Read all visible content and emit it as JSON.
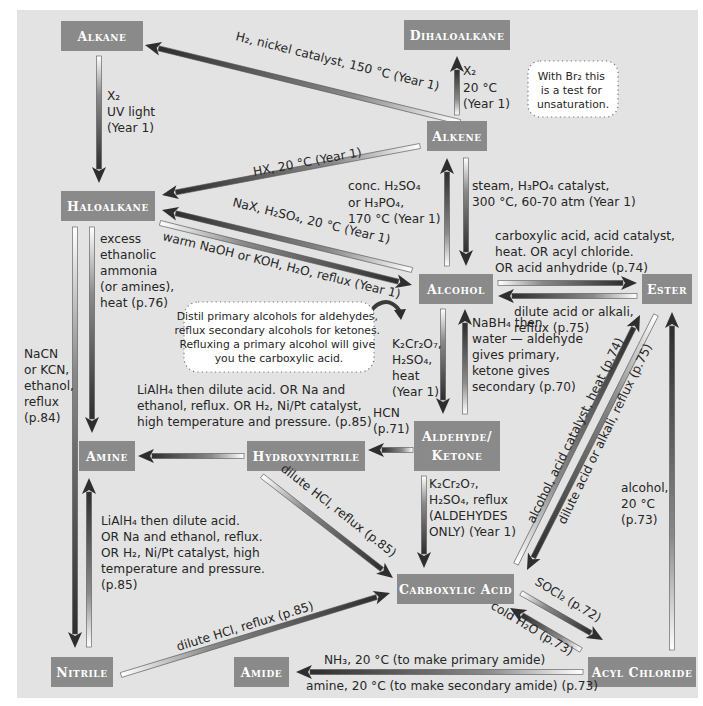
{
  "colors": {
    "background": "#e3e3e3",
    "node_fill": "#8a8a8a",
    "node_text": "#ffffff",
    "arrow_dark": "#3a3a3a",
    "arrow_light": "#ffffff",
    "label_text": "#262626"
  },
  "nodes": [
    {
      "id": "alkane",
      "label": "Alkane",
      "x": 61,
      "y": 21,
      "w": 82,
      "h": 30
    },
    {
      "id": "dihaloalkane",
      "label": "Dihaloalkane",
      "x": 404,
      "y": 20,
      "w": 106,
      "h": 30
    },
    {
      "id": "alkene",
      "label": "Alkene",
      "x": 427,
      "y": 121,
      "w": 60,
      "h": 30
    },
    {
      "id": "haloalkane",
      "label": "Haloalkane",
      "x": 61,
      "y": 191,
      "w": 94,
      "h": 30
    },
    {
      "id": "alcohol",
      "label": "Alcohol",
      "x": 419,
      "y": 274,
      "w": 74,
      "h": 30
    },
    {
      "id": "ester",
      "label": "Ester",
      "x": 642,
      "y": 274,
      "w": 50,
      "h": 30
    },
    {
      "id": "amine",
      "label": "Amine",
      "x": 79,
      "y": 441,
      "w": 56,
      "h": 30
    },
    {
      "id": "hydroxynitrile",
      "label": "Hydroxynitrile",
      "x": 247,
      "y": 441,
      "w": 118,
      "h": 30
    },
    {
      "id": "aldehyde_ketone",
      "label": "Aldehyde/",
      "label2": "Ketone",
      "x": 414,
      "y": 421,
      "w": 86,
      "h": 50
    },
    {
      "id": "carboxylic_acid",
      "label": "Carboxylic Acid",
      "x": 397,
      "y": 574,
      "w": 117,
      "h": 30
    },
    {
      "id": "nitrile",
      "label": "Nitrile",
      "x": 51,
      "y": 657,
      "w": 62,
      "h": 30
    },
    {
      "id": "amide",
      "label": "Amide",
      "x": 234,
      "y": 657,
      "w": 55,
      "h": 30
    },
    {
      "id": "acyl_chloride",
      "label": "Acyl Chloride",
      "x": 588,
      "y": 657,
      "w": 108,
      "h": 30
    }
  ],
  "arrows": [
    {
      "id": "alkene-to-alkane",
      "from": [
        460,
        122
      ],
      "to": [
        145,
        45
      ],
      "label": "alkene → alkane"
    },
    {
      "id": "alkane-to-haloalkane",
      "from": [
        99,
        56
      ],
      "to": [
        99,
        183
      ],
      "label": "alkane → haloalkane"
    },
    {
      "id": "alkene-to-dihaloalkane",
      "from": [
        457,
        115
      ],
      "to": [
        457,
        56
      ],
      "label": "alkene → dihaloalkane"
    },
    {
      "id": "alkene-to-haloalkane",
      "from": [
        420,
        146
      ],
      "to": [
        162,
        195
      ],
      "label": "alkene → haloalkane"
    },
    {
      "id": "alcohol-to-alkene",
      "from": [
        447,
        266
      ],
      "to": [
        447,
        158
      ],
      "label": "alcohol → alkene"
    },
    {
      "id": "alkene-to-alcohol",
      "from": [
        466,
        158
      ],
      "to": [
        466,
        266
      ],
      "label": "alkene → alcohol"
    },
    {
      "id": "alcohol-to-haloalkane",
      "from": [
        412,
        270
      ],
      "to": [
        162,
        210
      ],
      "label": "alcohol → haloalkane"
    },
    {
      "id": "haloalkane-to-alcohol",
      "from": [
        160,
        223
      ],
      "to": [
        412,
        285
      ],
      "label": "haloalkane → alcohol"
    },
    {
      "id": "alcohol-to-ester",
      "from": [
        498,
        283
      ],
      "to": [
        637,
        283
      ],
      "label": "alcohol → ester"
    },
    {
      "id": "ester-to-alcohol",
      "from": [
        637,
        296
      ],
      "to": [
        498,
        296
      ],
      "label": "ester → alcohol"
    },
    {
      "id": "haloalkane-to-amine",
      "from": [
        92,
        227
      ],
      "to": [
        92,
        433
      ],
      "label": "haloalkane → amine"
    },
    {
      "id": "haloalkane-to-nitrile",
      "from": [
        75,
        227
      ],
      "to": [
        75,
        648
      ],
      "label": "haloalkane → nitrile"
    },
    {
      "id": "nitrile-to-amine",
      "from": [
        89,
        647
      ],
      "to": [
        89,
        478
      ],
      "label": "nitrile → amine"
    },
    {
      "id": "alcohol-to-aldehyde",
      "from": [
        443,
        309
      ],
      "to": [
        443,
        414
      ],
      "label": "alcohol → aldehyde/ketone"
    },
    {
      "id": "aldehyde-to-alcohol",
      "from": [
        465,
        414
      ],
      "to": [
        465,
        309
      ],
      "label": "aldehyde/ketone → alcohol"
    },
    {
      "id": "aldehyde-to-hydroxynitrile",
      "from": [
        413,
        450
      ],
      "to": [
        368,
        450
      ],
      "label": "aldehyde → hydroxynitrile"
    },
    {
      "id": "hydroxynitrile-to-amine",
      "from": [
        244,
        456
      ],
      "to": [
        138,
        456
      ],
      "label": "hydroxynitrile → amine"
    },
    {
      "id": "hydroxynitrile-to-carboxylic",
      "from": [
        262,
        476
      ],
      "to": [
        393,
        578
      ],
      "label": "hydroxynitrile → carboxylic acid"
    },
    {
      "id": "aldehyde-to-carboxylic",
      "from": [
        424,
        476
      ],
      "to": [
        424,
        568
      ],
      "label": "aldehyde → carboxylic acid"
    },
    {
      "id": "carboxylic-to-ester",
      "from": [
        516,
        564
      ],
      "to": [
        640,
        315
      ],
      "label": "carboxylic acid → ester"
    },
    {
      "id": "ester-to-carboxylic",
      "from": [
        656,
        315
      ],
      "to": [
        527,
        570
      ],
      "label": "ester → carboxylic acid"
    },
    {
      "id": "acyl-to-ester",
      "from": [
        672,
        650
      ],
      "to": [
        672,
        312
      ],
      "label": "acyl chloride → ester"
    },
    {
      "id": "carboxylic-to-acyl",
      "from": [
        521,
        593
      ],
      "to": [
        603,
        640
      ],
      "label": "carboxylic acid → acyl chloride"
    },
    {
      "id": "acyl-to-carboxylic",
      "from": [
        581,
        650
      ],
      "to": [
        510,
        608
      ],
      "label": "acyl chloride → carboxylic acid"
    },
    {
      "id": "nitrile-to-carboxylic",
      "from": [
        121,
        675
      ],
      "to": [
        390,
        593
      ],
      "label": "nitrile → carboxylic acid"
    },
    {
      "id": "acyl-to-amide",
      "from": [
        583,
        672
      ],
      "to": [
        296,
        672
      ],
      "label": "acyl chloride → amide"
    }
  ],
  "labels": {
    "alkene_alkane": "H₂, nickel catalyst, 150 °C (Year 1)",
    "alkane_haloalkane": [
      "X₂",
      "UV light",
      "(Year 1)"
    ],
    "alkene_dihaloalkane": [
      "X₂",
      "20 °C",
      "(Year 1)"
    ],
    "alkene_haloalkane": "HX, 20 °C (Year 1)",
    "alcohol_alkene": [
      "conc. H₂SO₄",
      "or H₃PO₄,",
      "170 °C (Year 1)"
    ],
    "alkene_alcohol": [
      "steam, H₃PO₄ catalyst,",
      "300 °C, 60-70 atm (Year 1)"
    ],
    "alcohol_haloalkane": "NaX, H₂SO₄, 20 °C (Year 1)",
    "haloalkane_alcohol": "warm NaOH or KOH, H₂O, reflux (Year 1)",
    "alcohol_ester": [
      "carboxylic acid, acid catalyst,",
      "heat.  OR acyl chloride.",
      "OR acid anhydride (p.74)"
    ],
    "ester_alcohol": [
      "dilute acid or alkali,",
      "reflux (p.75)"
    ],
    "haloalkane_amine": [
      "excess",
      "ethanolic",
      "ammonia",
      "(or amines),",
      "heat (p.76)"
    ],
    "haloalkane_nitrile": [
      "NaCN",
      "or KCN,",
      "ethanol,",
      "reflux",
      "(p.84)"
    ],
    "alcohol_aldehyde": [
      "K₂Cr₂O₇,",
      "H₂SO₄,",
      "heat",
      "(Year 1)"
    ],
    "aldehyde_alcohol": [
      "NaBH₄ then",
      "water — aldehyde",
      "gives primary,",
      "ketone gives",
      "secondary (p.70)"
    ],
    "hydroxynitrile_amine": [
      "LiAlH₄ then dilute acid. OR Na and",
      "ethanol, reflux. OR H₂, Ni/Pt catalyst,",
      "high temperature and pressure. (p.85)"
    ],
    "aldehyde_hydroxynitrile": [
      "HCN",
      "(p.71)"
    ],
    "hydroxynitrile_carboxylic": "dilute HCl, reflux (p.85)",
    "aldehyde_carboxylic": [
      "K₂Cr₂O₇,",
      "H₂SO₄, reflux",
      "(ALDEHYDES",
      "ONLY) (Year 1)"
    ],
    "carboxylic_ester": "alcohol, acid catalyst, heat (p.74)",
    "ester_carboxylic": "dilute acid or alkali, reflux (p.75)",
    "acyl_ester": [
      "alcohol,",
      "20 °C",
      "(p.73)"
    ],
    "nitrile_amine": [
      "LiAlH₄ then dilute acid.",
      "OR Na and ethanol, reflux.",
      "OR H₂, Ni/Pt catalyst, high",
      "temperature and pressure.",
      "(p.85)"
    ],
    "nitrile_carboxylic": "dilute HCl, reflux (p.85)",
    "carboxylic_acyl": "SOCl₂ (p.72)",
    "acyl_carboxylic": "cold H₂O (p.73)",
    "acyl_amide_primary": "NH₃, 20 °C (to make primary amide)",
    "acyl_amide_secondary": "amine, 20 °C (to make secondary amide) (p.73)"
  },
  "notes": {
    "bromine_test": [
      "With Br₂ this",
      "is a test for",
      "unsaturation."
    ],
    "oxidation": [
      "Distil primary alcohols for aldehydes,",
      "reflux secondary alcohols for ketones.",
      "Refluxing a primary alcohol will give",
      "you the carboxylic acid."
    ]
  }
}
